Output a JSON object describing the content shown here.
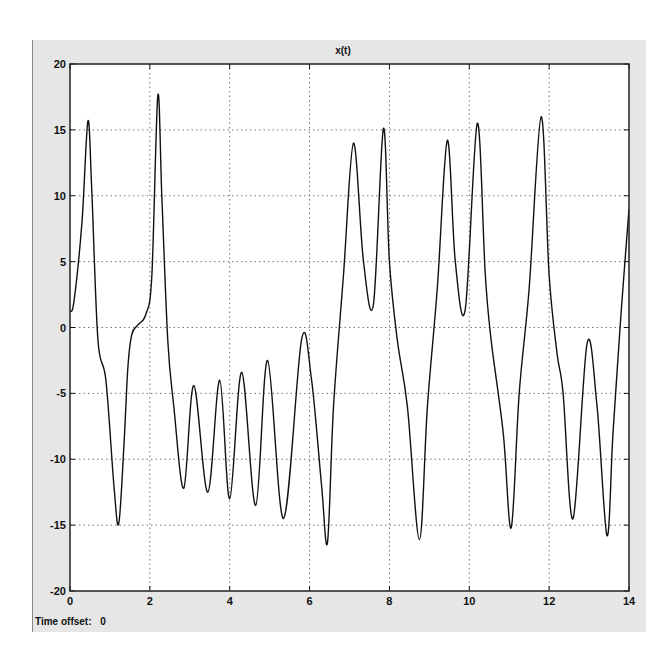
{
  "window": {
    "frame_color": "#e6e6e6",
    "plot_bg": "#ffffff",
    "line_color": "#111111",
    "grid_color": "#777777"
  },
  "footer": {
    "time_offset_label": "Time offset:",
    "time_offset_value": "0"
  },
  "chart_data": {
    "type": "line",
    "title": "x(t)",
    "xlabel": "",
    "ylabel": "",
    "xlim": [
      0,
      14
    ],
    "ylim": [
      -20,
      20
    ],
    "xticks": [
      0,
      2,
      4,
      6,
      8,
      10,
      12,
      14
    ],
    "yticks": [
      -20,
      -15,
      -10,
      -5,
      0,
      5,
      10,
      15,
      20
    ],
    "grid": true,
    "legend": null,
    "series": [
      {
        "name": "x(t)",
        "x": [
          0,
          0.1,
          0.3,
          0.45,
          0.55,
          0.7,
          0.9,
          1.1,
          1.22,
          1.35,
          1.45,
          1.55,
          1.7,
          1.9,
          2.05,
          2.2,
          2.3,
          2.45,
          2.6,
          2.85,
          3.1,
          3.45,
          3.75,
          4.0,
          4.3,
          4.65,
          4.95,
          5.35,
          5.8,
          6.05,
          6.3,
          6.45,
          6.6,
          6.85,
          7.1,
          7.35,
          7.6,
          7.85,
          8.0,
          8.2,
          8.45,
          8.75,
          8.95,
          9.2,
          9.45,
          9.65,
          9.9,
          10.2,
          10.4,
          10.55,
          10.85,
          11.05,
          11.25,
          11.5,
          11.8,
          12.0,
          12.2,
          12.35,
          12.6,
          12.95,
          13.2,
          13.45,
          13.6,
          13.8,
          14.0
        ],
        "values": [
          1.2,
          2,
          8,
          15.7,
          10,
          -1,
          -4,
          -12,
          -14.9,
          -9,
          -3,
          -0.5,
          0.2,
          1,
          4,
          17.6,
          10,
          -1,
          -6,
          -12.2,
          -4.4,
          -12.5,
          -4,
          -13,
          -3.4,
          -13.5,
          -2.5,
          -14.5,
          -0.9,
          -4,
          -12,
          -16.3,
          -6,
          4,
          14,
          5,
          1.8,
          15.1,
          5,
          -1,
          -6,
          -16.1,
          -6,
          3,
          14.2,
          5,
          1.4,
          15.5,
          4,
          -1,
          -8,
          -15.2,
          -5,
          3,
          16,
          4,
          -2,
          -5,
          -14.5,
          -1.2,
          -6,
          -15.8,
          -8,
          1,
          9
        ]
      }
    ]
  }
}
